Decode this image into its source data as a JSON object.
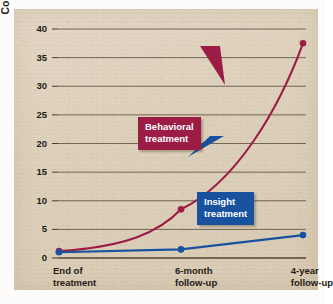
{
  "chart_data": {
    "type": "line",
    "title": "",
    "subtitle": "",
    "xlabel": "",
    "ylabel": "Couples divorced (percentage)",
    "categories": [
      "End of treatment",
      "6-month follow-up",
      "4-year follow-up"
    ],
    "category_lines": [
      [
        "End of",
        "treatment"
      ],
      [
        "6-month",
        "follow-up"
      ],
      [
        "4-year",
        "follow-up"
      ]
    ],
    "ylim": [
      0,
      40
    ],
    "yticks": [
      0,
      5,
      10,
      15,
      20,
      25,
      30,
      35,
      40
    ],
    "ytick_labels": [
      "0",
      "5",
      "10",
      "15",
      "20",
      "25",
      "30",
      "35",
      "40"
    ],
    "grid": true,
    "legend_position": "annotations-on-plot",
    "series": [
      {
        "name": "Behavioral treatment",
        "color": "#9c1c46",
        "values": [
          1.2,
          8.5,
          37.5
        ],
        "curve": "exponential"
      },
      {
        "name": "Insight treatment",
        "color": "#18529f",
        "values": [
          1.0,
          1.5,
          4.0
        ],
        "curve": "linear"
      }
    ],
    "annotations": [
      {
        "label": "Behavioral treatment",
        "label_lines": [
          "Behavioral",
          "treatment"
        ],
        "color": "#9c1c46",
        "points_to_series": "Behavioral treatment"
      },
      {
        "label": "Insight treatment",
        "label_lines": [
          "Insight",
          "treatment"
        ],
        "color": "#18529f",
        "points_to_series": "Insight treatment"
      }
    ]
  },
  "colors": {
    "panel_background": "#ded0bb",
    "page_background": "#fdfcfa",
    "gridline": "#4a3a28",
    "axis": "#4a3a28",
    "behavioral": "#9c1c46",
    "insight": "#18529f",
    "text": "#241c15"
  }
}
